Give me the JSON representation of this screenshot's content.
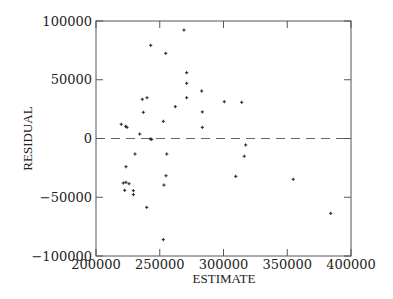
{
  "chart_data": {
    "type": "scatter",
    "title": "",
    "xlabel": "ESTIMATE",
    "ylabel": "RESIDUAL",
    "xlim": [
      200000,
      400000
    ],
    "ylim": [
      -100000,
      100000
    ],
    "x_ticks": [
      200000,
      250000,
      300000,
      350000,
      400000
    ],
    "x_tick_labels": [
      "200000",
      "250000",
      "300000",
      "350000",
      "400000"
    ],
    "y_ticks": [
      100000,
      50000,
      0,
      -50000,
      -100000
    ],
    "y_tick_labels": [
      "100000",
      "50000",
      "0",
      "−50000",
      "−100000"
    ],
    "grid": false,
    "legend": null,
    "reference_line": {
      "y": 0,
      "style": "dashed"
    },
    "marker": "+",
    "colors": {
      "axis": "#555555",
      "points": "#222222",
      "reference_line": "#666666",
      "text": "#222222"
    },
    "points": [
      {
        "x": 219800,
        "y": 12100
      },
      {
        "x": 223300,
        "y": 10400
      },
      {
        "x": 224300,
        "y": 9500
      },
      {
        "x": 234300,
        "y": 3800
      },
      {
        "x": 237100,
        "y": 22300
      },
      {
        "x": 236300,
        "y": 33400
      },
      {
        "x": 240000,
        "y": 34700
      },
      {
        "x": 242900,
        "y": 79300
      },
      {
        "x": 254700,
        "y": 72500
      },
      {
        "x": 269000,
        "y": 92300
      },
      {
        "x": 271100,
        "y": 56000
      },
      {
        "x": 271100,
        "y": 47000
      },
      {
        "x": 271100,
        "y": 34700
      },
      {
        "x": 262200,
        "y": 27100
      },
      {
        "x": 252800,
        "y": 14600
      },
      {
        "x": 282900,
        "y": 40400
      },
      {
        "x": 283400,
        "y": 22600
      },
      {
        "x": 283400,
        "y": 9500
      },
      {
        "x": 300600,
        "y": 31300
      },
      {
        "x": 314300,
        "y": 30800
      },
      {
        "x": 242600,
        "y": -400
      },
      {
        "x": 243700,
        "y": -700
      },
      {
        "x": 317400,
        "y": -5500
      },
      {
        "x": 316300,
        "y": -15100
      },
      {
        "x": 255500,
        "y": -13200
      },
      {
        "x": 230600,
        "y": -13200
      },
      {
        "x": 223500,
        "y": -24000
      },
      {
        "x": 221400,
        "y": -37900
      },
      {
        "x": 223500,
        "y": -37300
      },
      {
        "x": 225900,
        "y": -38500
      },
      {
        "x": 222500,
        "y": -44100
      },
      {
        "x": 229300,
        "y": -44400
      },
      {
        "x": 229300,
        "y": -47800
      },
      {
        "x": 254900,
        "y": -31700
      },
      {
        "x": 253300,
        "y": -39600
      },
      {
        "x": 239800,
        "y": -58600
      },
      {
        "x": 252800,
        "y": -86100
      },
      {
        "x": 309600,
        "y": -32200
      },
      {
        "x": 354700,
        "y": -34700
      },
      {
        "x": 384100,
        "y": -63700
      }
    ]
  },
  "layout": {
    "plot_left": 96,
    "plot_right": 351,
    "plot_top": 21,
    "plot_bottom": 256
  }
}
